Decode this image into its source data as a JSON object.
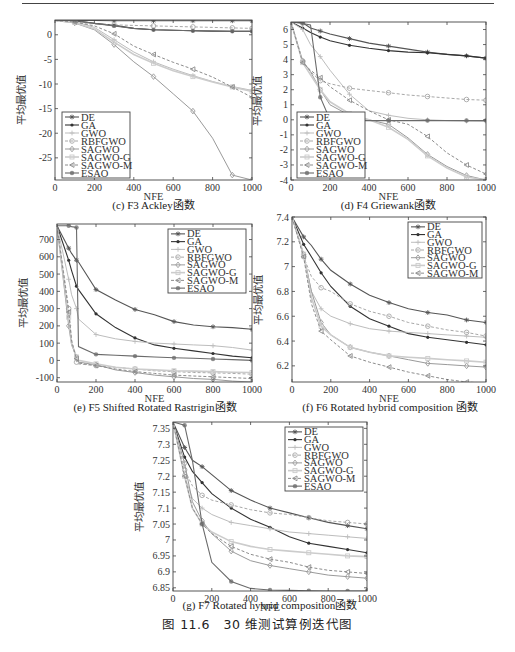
{
  "figure": {
    "caption": "图 11.6　30 维测试算例迭代图"
  },
  "chart_data": [
    {
      "id": "f3",
      "type": "line",
      "title": "(c) F3 Ackley函数",
      "xlabel": "NFE",
      "ylabel": "平均最优值",
      "xlim": [
        0,
        1000
      ],
      "ylim": [
        -29.5,
        3
      ],
      "xticks": [
        0,
        200,
        400,
        600,
        800,
        1000
      ],
      "yticks": [
        0,
        -5,
        -10,
        -15,
        -20,
        -25
      ],
      "legend_position": "lower-left",
      "box": {
        "left": 55,
        "top": 20,
        "right": 252,
        "bottom": 180
      },
      "legend": {
        "x": 62,
        "y": 112,
        "w": 68,
        "h": 66
      },
      "x": [
        0,
        100,
        200,
        300,
        400,
        500,
        600,
        700,
        800,
        900,
        1000
      ],
      "series": [
        {
          "name": "DE",
          "values": [
            2.9,
            2.9,
            2.9,
            2.85,
            2.85,
            2.85,
            2.85,
            2.85,
            2.85,
            2.85,
            2.85
          ]
        },
        {
          "name": "GA",
          "values": [
            2.9,
            2.85,
            2.3,
            1.9,
            1.3,
            1.0,
            0.9,
            0.8,
            0.75,
            0.7,
            0.7
          ]
        },
        {
          "name": "GWO",
          "values": [
            2.9,
            2.7,
            1.5,
            -1.0,
            -3.5,
            -5.5,
            -7.0,
            -8.3,
            -9.5,
            -10.5,
            -11.3
          ]
        },
        {
          "name": "RBFGWO",
          "values": [
            2.9,
            2.6,
            2.2,
            2.0,
            1.9,
            1.8,
            1.7,
            1.6,
            1.5,
            1.4,
            1.3
          ]
        },
        {
          "name": "SAGWO",
          "values": [
            2.9,
            2.4,
            1.0,
            -2.0,
            -5.5,
            -8.5,
            -12.0,
            -15.5,
            -21.0,
            -28.5,
            -29.5
          ]
        },
        {
          "name": "SAGWO-G",
          "values": [
            2.9,
            2.5,
            1.2,
            -1.5,
            -4.0,
            -5.8,
            -7.3,
            -8.5,
            -9.6,
            -10.6,
            -11.5
          ]
        },
        {
          "name": "SAGWO-M",
          "values": [
            2.9,
            2.6,
            1.8,
            0.2,
            -2.3,
            -4.0,
            -5.6,
            -7.0,
            -8.6,
            -10.6,
            -12.7
          ]
        },
        {
          "name": "ESAO",
          "values": [
            2.9,
            2.9,
            2.3,
            1.8,
            1.3,
            1.0,
            0.9,
            0.8,
            0.75,
            0.7,
            0.7
          ]
        }
      ]
    },
    {
      "id": "f4",
      "type": "line",
      "title": "(d) F4 Griewank函数",
      "xlabel": "NFE",
      "ylabel": "平均最优值",
      "xlim": [
        0,
        1000
      ],
      "ylim": [
        -4,
        6.5
      ],
      "xticks": [
        0,
        200,
        400,
        600,
        800,
        1000
      ],
      "yticks": [
        6,
        5,
        4,
        3,
        2,
        1,
        0,
        -1,
        -2,
        -3,
        -4
      ],
      "legend_position": "lower-left",
      "box": {
        "left": 291,
        "top": 22,
        "right": 486,
        "bottom": 180
      },
      "legend": {
        "x": 297,
        "y": 112,
        "w": 68,
        "h": 66
      },
      "x": [
        0,
        60,
        100,
        150,
        200,
        300,
        400,
        500,
        600,
        700,
        800,
        900,
        1000
      ],
      "series": [
        {
          "name": "DE",
          "values": [
            6.5,
            6.45,
            6.1,
            5.9,
            5.7,
            5.4,
            5.1,
            4.9,
            4.7,
            4.5,
            4.35,
            4.25,
            4.1
          ]
        },
        {
          "name": "GA",
          "values": [
            6.5,
            6.1,
            5.8,
            5.5,
            5.25,
            4.95,
            4.75,
            4.6,
            4.5,
            4.45,
            4.35,
            4.25,
            4.1
          ]
        },
        {
          "name": "GWO",
          "values": [
            6.5,
            6.0,
            5.0,
            4.2,
            3.3,
            1.7,
            0.6,
            0.3,
            0.1,
            0.0,
            -0.05,
            -0.08,
            -0.1
          ]
        },
        {
          "name": "RBFGWO",
          "values": [
            6.5,
            3.9,
            3.2,
            2.6,
            2.4,
            2.1,
            1.95,
            1.8,
            1.65,
            1.55,
            1.45,
            1.35,
            1.3
          ]
        },
        {
          "name": "SAGWO",
          "values": [
            6.5,
            3.9,
            3.2,
            2.0,
            1.0,
            0.3,
            0.0,
            -0.3,
            -1.2,
            -2.3,
            -3.1,
            -3.7,
            -4.0
          ]
        },
        {
          "name": "SAGWO-G",
          "values": [
            6.5,
            3.8,
            3.0,
            2.0,
            1.2,
            0.4,
            0.0,
            -0.5,
            -1.3,
            -2.4,
            -3.2,
            -3.8,
            -4.0
          ]
        },
        {
          "name": "SAGWO-M",
          "values": [
            6.5,
            3.8,
            3.3,
            2.8,
            2.2,
            1.3,
            0.6,
            0.0,
            -0.3,
            -1.1,
            -2.2,
            -3.0,
            -3.6
          ]
        },
        {
          "name": "ESAO",
          "values": [
            6.5,
            6.4,
            6.3,
            1.5,
            0.0,
            -0.05,
            -0.05,
            -0.05,
            -0.05,
            -0.05,
            -0.05,
            -0.05,
            -0.05
          ]
        }
      ]
    },
    {
      "id": "f5",
      "type": "line",
      "title": "(e) F5 Shifted Rotated Rastrigin函数",
      "xlabel": "NFE",
      "ylabel": "平均最优值",
      "xlim": [
        0,
        1000
      ],
      "ylim": [
        -125,
        790
      ],
      "xticks": [
        0,
        200,
        400,
        600,
        800,
        1000
      ],
      "yticks": [
        700,
        600,
        500,
        400,
        300,
        200,
        100,
        0,
        -100
      ],
      "legend_position": "upper-right",
      "box": {
        "left": 57,
        "top": 224,
        "right": 252,
        "bottom": 382
      },
      "legend": {
        "x": 168,
        "y": 229,
        "w": 78,
        "h": 64
      },
      "x": [
        0,
        60,
        75,
        100,
        110,
        200,
        300,
        400,
        500,
        600,
        700,
        800,
        900,
        1000
      ],
      "series": [
        {
          "name": "DE",
          "values": [
            780,
            650,
            620,
            580,
            570,
            410,
            350,
            295,
            265,
            225,
            205,
            195,
            190,
            180
          ]
        },
        {
          "name": "GA",
          "values": [
            780,
            580,
            520,
            430,
            410,
            270,
            190,
            130,
            90,
            70,
            55,
            40,
            25,
            15
          ]
        },
        {
          "name": "GWO",
          "values": [
            780,
            470,
            380,
            300,
            240,
            150,
            125,
            110,
            100,
            95,
            90,
            85,
            75,
            60
          ]
        },
        {
          "name": "RBFGWO",
          "values": [
            780,
            300,
            120,
            -10,
            -20,
            -30,
            -40,
            -50,
            -60,
            -65,
            -70,
            -72,
            -75,
            -80
          ]
        },
        {
          "name": "SAGWO",
          "values": [
            780,
            200,
            90,
            20,
            -10,
            -25,
            -55,
            -70,
            -85,
            -95,
            -105,
            -110,
            -120,
            -125
          ]
        },
        {
          "name": "SAGWO-G",
          "values": [
            780,
            250,
            100,
            20,
            0,
            -20,
            -40,
            -50,
            -55,
            -60,
            -62,
            -65,
            -68,
            -70
          ]
        },
        {
          "name": "SAGWO-M",
          "values": [
            780,
            280,
            110,
            10,
            -15,
            -30,
            -50,
            -65,
            -75,
            -85,
            -90,
            -95,
            -100,
            -105
          ]
        },
        {
          "name": "ESAO",
          "values": [
            780,
            780,
            775,
            770,
            80,
            35,
            30,
            25,
            20,
            15,
            12,
            8,
            5,
            0
          ]
        }
      ]
    },
    {
      "id": "f6",
      "type": "line",
      "title": "(f) F6 Rotated hybrid composition 函数",
      "xlabel": "NFE",
      "ylabel": "平均最优值",
      "xlim": [
        0,
        1000
      ],
      "ylim": [
        6.07,
        7.4
      ],
      "xticks": [
        0,
        200,
        400,
        600,
        800,
        1000
      ],
      "yticks": [
        7.4,
        7.2,
        7,
        6.8,
        6.6,
        6.4,
        6.2
      ],
      "legend_position": "upper-right",
      "box": {
        "left": 292,
        "top": 217,
        "right": 486,
        "bottom": 382
      },
      "legend": {
        "x": 408,
        "y": 222,
        "w": 74,
        "h": 56
      },
      "x": [
        0,
        60,
        100,
        150,
        200,
        300,
        400,
        500,
        600,
        700,
        800,
        900,
        1000
      ],
      "series": [
        {
          "name": "DE",
          "values": [
            7.4,
            7.24,
            7.17,
            7.06,
            6.97,
            6.86,
            6.77,
            6.71,
            6.66,
            6.63,
            6.61,
            6.57,
            6.55
          ]
        },
        {
          "name": "GA",
          "values": [
            7.4,
            7.18,
            7.08,
            6.95,
            6.84,
            6.68,
            6.58,
            6.52,
            6.46,
            6.43,
            6.41,
            6.39,
            6.37
          ]
        },
        {
          "name": "GWO",
          "values": [
            7.4,
            7.1,
            6.8,
            6.66,
            6.6,
            6.54,
            6.5,
            6.48,
            6.47,
            6.46,
            6.45,
            6.44,
            6.43
          ]
        },
        {
          "name": "RBFGWO",
          "values": [
            7.4,
            7.08,
            6.92,
            6.83,
            6.8,
            6.7,
            6.64,
            6.6,
            6.55,
            6.52,
            6.49,
            6.47,
            6.44
          ]
        },
        {
          "name": "SAGWO",
          "values": [
            7.4,
            7.1,
            6.8,
            6.55,
            6.45,
            6.35,
            6.31,
            6.28,
            6.25,
            6.22,
            6.21,
            6.2,
            6.19
          ]
        },
        {
          "name": "SAGWO-G",
          "values": [
            7.4,
            7.1,
            6.75,
            6.52,
            6.45,
            6.35,
            6.31,
            6.28,
            6.27,
            6.26,
            6.25,
            6.24,
            6.23
          ]
        },
        {
          "name": "SAGWO-M",
          "values": [
            7.4,
            7.08,
            6.7,
            6.48,
            6.41,
            6.28,
            6.23,
            6.19,
            6.15,
            6.12,
            6.09,
            6.07,
            6.06
          ]
        }
      ]
    },
    {
      "id": "f7",
      "type": "line",
      "title": "(g) F7 Rotated hybrid composition函数",
      "xlabel": "NFE",
      "ylabel": "平均最优值",
      "xlim": [
        0,
        1000
      ],
      "ylim": [
        6.84,
        7.37
      ],
      "xticks": [
        0,
        200,
        400,
        600,
        800,
        1000
      ],
      "yticks": [
        7.35,
        7.3,
        7.25,
        7.2,
        7.15,
        7.1,
        7.05,
        7,
        6.95,
        6.9,
        6.85
      ],
      "legend_position": "upper-right",
      "box": {
        "left": 173,
        "top": 422,
        "right": 367,
        "bottom": 591
      },
      "legend": {
        "x": 285,
        "y": 427,
        "w": 78,
        "h": 64
      },
      "x": [
        0,
        60,
        100,
        150,
        200,
        300,
        400,
        500,
        600,
        700,
        800,
        900,
        1000
      ],
      "series": [
        {
          "name": "DE",
          "values": [
            7.37,
            7.29,
            7.25,
            7.23,
            7.205,
            7.155,
            7.125,
            7.1,
            7.085,
            7.07,
            7.055,
            7.045,
            7.035
          ]
        },
        {
          "name": "GA",
          "values": [
            7.37,
            7.26,
            7.215,
            7.18,
            7.145,
            7.1,
            7.065,
            7.04,
            7.01,
            6.99,
            6.98,
            6.97,
            6.96
          ]
        },
        {
          "name": "GWO",
          "values": [
            7.37,
            7.2,
            7.13,
            7.1,
            7.08,
            7.055,
            7.045,
            7.035,
            7.025,
            7.02,
            7.015,
            7.01,
            7.005
          ]
        },
        {
          "name": "RBFGWO",
          "values": [
            7.37,
            7.22,
            7.17,
            7.14,
            7.125,
            7.11,
            7.095,
            7.085,
            7.08,
            7.07,
            7.06,
            7.055,
            7.05
          ]
        },
        {
          "name": "SAGWO",
          "values": [
            7.37,
            7.24,
            7.12,
            7.06,
            7.02,
            6.965,
            6.935,
            6.92,
            6.91,
            6.9,
            6.89,
            6.885,
            6.88
          ]
        },
        {
          "name": "SAGWO-G",
          "values": [
            7.37,
            7.2,
            7.1,
            7.05,
            7.025,
            6.995,
            6.98,
            6.97,
            6.965,
            6.96,
            6.955,
            6.95,
            6.948
          ]
        },
        {
          "name": "SAGWO-M",
          "values": [
            7.37,
            7.2,
            7.1,
            7.05,
            7.02,
            6.98,
            6.955,
            6.94,
            6.93,
            6.915,
            6.905,
            6.9,
            6.895
          ]
        },
        {
          "name": "ESAO",
          "values": [
            7.37,
            7.36,
            7.25,
            7.05,
            6.93,
            6.87,
            6.848,
            6.843,
            6.842,
            6.841,
            6.84,
            6.84,
            6.84
          ]
        }
      ]
    }
  ],
  "series_styles": {
    "DE": {
      "color": "#555555",
      "dash": "",
      "marker": "star",
      "width": 1.1
    },
    "GA": {
      "color": "#333333",
      "dash": "",
      "marker": "dot",
      "width": 1.1
    },
    "GWO": {
      "color": "#bdbdbd",
      "dash": "",
      "marker": "plus",
      "width": 1.0
    },
    "RBFGWO": {
      "color": "#a8a8a8",
      "dash": "3,2",
      "marker": "circle",
      "width": 1.0
    },
    "SAGWO": {
      "color": "#9a9a9a",
      "dash": "",
      "marker": "diamond",
      "width": 1.0
    },
    "SAGWO-G": {
      "color": "#cccccc",
      "dash": "",
      "marker": "square",
      "width": 1.6
    },
    "SAGWO-M": {
      "color": "#8c8c8c",
      "dash": "3,2",
      "marker": "triangle",
      "width": 1.0
    },
    "ESAO": {
      "color": "#6a6a6a",
      "dash": "",
      "marker": "hexdot",
      "width": 1.1
    }
  }
}
